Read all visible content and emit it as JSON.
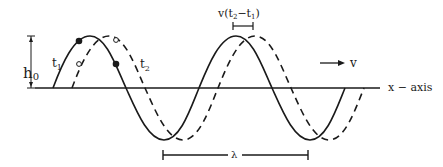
{
  "diagram": {
    "type": "traveling-wave",
    "colors": {
      "ink": "#1a1a1a",
      "background": "#ffffff"
    },
    "labels": {
      "amplitude": "h",
      "amplitude_sub": "0",
      "t1": "t",
      "t1_sub": "1",
      "t2": "t",
      "t2_sub": "2",
      "displacement_prefix": "v(t",
      "displacement_sub2": "2",
      "displacement_mid": "−t",
      "displacement_sub1": "1",
      "displacement_suffix": ")",
      "velocity": "v",
      "x_axis": "x − axis",
      "wavelength": "λ"
    },
    "waves": [
      {
        "name": "wave-at-t1",
        "style": "solid"
      },
      {
        "name": "wave-at-t2",
        "style": "dashed"
      }
    ],
    "markers": [
      {
        "name": "point-t1-solid",
        "style": "filled"
      },
      {
        "name": "point-t2-solid",
        "style": "filled"
      },
      {
        "name": "point-t1-dashed",
        "style": "open"
      },
      {
        "name": "point-t2-dashed",
        "style": "open"
      }
    ]
  }
}
